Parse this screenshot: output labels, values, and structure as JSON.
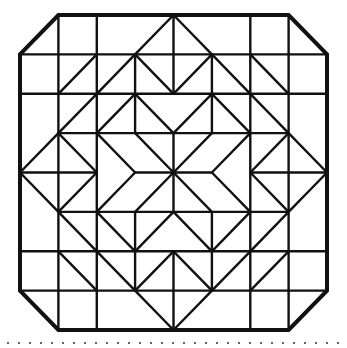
{
  "diagram": {
    "title": "",
    "colors": {
      "stroke": "#111111",
      "background": "#ffffff",
      "dots": "#333333"
    },
    "grid": {
      "x": [
        20,
        58.4,
        96.8,
        135.1,
        173.5,
        211.9,
        250.3,
        288.6,
        327
      ],
      "y": [
        15,
        54.4,
        93.8,
        133.1,
        172.5,
        211.9,
        251.3,
        290.6,
        330
      ]
    },
    "border": [
      [
        1,
        0
      ],
      [
        7,
        0
      ],
      [
        8,
        1
      ],
      [
        8,
        7
      ],
      [
        7,
        8
      ],
      [
        1,
        8
      ],
      [
        0,
        7
      ],
      [
        0,
        1
      ]
    ],
    "border_width": 4,
    "line_width": 2.4,
    "segments": [
      [
        0,
        1,
        8,
        1
      ],
      [
        0,
        2,
        8,
        2
      ],
      [
        1,
        3,
        7,
        3
      ],
      [
        0,
        4,
        2,
        4
      ],
      [
        3,
        4,
        5,
        4
      ],
      [
        6,
        4,
        8,
        4
      ],
      [
        1,
        5,
        7,
        5
      ],
      [
        0,
        6,
        8,
        6
      ],
      [
        0,
        7,
        8,
        7
      ],
      [
        1,
        0,
        1,
        8
      ],
      [
        2,
        0,
        2,
        8
      ],
      [
        6,
        0,
        6,
        8
      ],
      [
        7,
        0,
        7,
        8
      ],
      [
        3,
        1,
        3,
        3
      ],
      [
        3,
        5,
        3,
        7
      ],
      [
        5,
        1,
        5,
        3
      ],
      [
        5,
        5,
        5,
        7
      ],
      [
        4,
        0,
        4,
        2
      ],
      [
        4,
        3,
        4,
        5
      ],
      [
        4,
        6,
        4,
        8
      ],
      [
        3,
        1,
        4,
        0
      ],
      [
        4,
        0,
        5,
        1
      ],
      [
        1,
        2,
        2,
        1
      ],
      [
        2,
        2,
        3,
        1
      ],
      [
        3,
        1,
        4,
        2
      ],
      [
        4,
        2,
        5,
        1
      ],
      [
        5,
        1,
        6,
        2
      ],
      [
        6,
        1,
        7,
        2
      ],
      [
        1,
        3,
        2,
        2
      ],
      [
        2,
        3,
        3,
        2
      ],
      [
        3,
        2,
        4,
        3
      ],
      [
        4,
        3,
        5,
        2
      ],
      [
        5,
        2,
        6,
        3
      ],
      [
        6,
        2,
        7,
        3
      ],
      [
        0,
        4,
        1,
        3
      ],
      [
        1,
        3,
        2,
        4
      ],
      [
        2,
        3,
        3,
        4
      ],
      [
        3,
        3,
        4,
        4
      ],
      [
        4,
        4,
        5,
        3
      ],
      [
        5,
        4,
        6,
        3
      ],
      [
        6,
        4,
        7,
        3
      ],
      [
        7,
        3,
        8,
        4
      ],
      [
        0,
        4,
        1,
        5
      ],
      [
        1,
        5,
        2,
        4
      ],
      [
        2,
        5,
        3,
        4
      ],
      [
        3,
        5,
        4,
        4
      ],
      [
        4,
        4,
        5,
        5
      ],
      [
        5,
        4,
        6,
        5
      ],
      [
        6,
        4,
        7,
        5
      ],
      [
        7,
        5,
        8,
        4
      ],
      [
        1,
        5,
        2,
        6
      ],
      [
        2,
        5,
        3,
        6
      ],
      [
        3,
        6,
        4,
        5
      ],
      [
        4,
        5,
        5,
        6
      ],
      [
        5,
        6,
        6,
        5
      ],
      [
        6,
        6,
        7,
        5
      ],
      [
        1,
        6,
        2,
        7
      ],
      [
        2,
        6,
        3,
        7
      ],
      [
        3,
        7,
        4,
        6
      ],
      [
        4,
        6,
        5,
        7
      ],
      [
        5,
        7,
        6,
        6
      ],
      [
        6,
        7,
        7,
        6
      ],
      [
        3,
        7,
        4,
        8
      ],
      [
        4,
        8,
        5,
        7
      ]
    ],
    "dotted_rule": {
      "y": 343,
      "x_start": 8,
      "x_end": 347,
      "spacing": 11
    }
  }
}
